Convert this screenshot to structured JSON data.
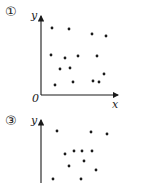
{
  "chart_data": [
    {
      "type": "scatter",
      "panel_label": "①",
      "title": "",
      "xlabel": "x",
      "ylabel": "y",
      "origin_label": "0",
      "grid": false,
      "points_px": [
        [
          52,
          28
        ],
        [
          69,
          29
        ],
        [
          92,
          34
        ],
        [
          106,
          36
        ],
        [
          51,
          55
        ],
        [
          65,
          58
        ],
        [
          78,
          56
        ],
        [
          97,
          56
        ],
        [
          60,
          69
        ],
        [
          70,
          68
        ],
        [
          104,
          74
        ],
        [
          55,
          85
        ],
        [
          73,
          82
        ],
        [
          93,
          81
        ],
        [
          99,
          82
        ]
      ],
      "axes_px": {
        "origin": [
          41,
          95
        ],
        "x_end": 117,
        "y_top": 17
      }
    },
    {
      "type": "scatter",
      "panel_label": "③",
      "title": "",
      "xlabel": "",
      "ylabel": "y",
      "grid": false,
      "points_px": [
        [
          57,
          131
        ],
        [
          91,
          132
        ],
        [
          107,
          134
        ],
        [
          65,
          154
        ],
        [
          74,
          151
        ],
        [
          82,
          151
        ],
        [
          92,
          151
        ],
        [
          84,
          161
        ],
        [
          69,
          166
        ],
        [
          96,
          170
        ],
        [
          53,
          179
        ],
        [
          81,
          179
        ]
      ],
      "axes_px": {
        "origin": [
          41,
          190
        ],
        "y_top": 121
      }
    }
  ],
  "labels": {
    "p1_num": "①",
    "p1_y": "y",
    "p1_x": "x",
    "p1_o": "0",
    "p3_num": "③",
    "p3_y": "y"
  },
  "colors": {
    "ink": "#1a1a1a"
  }
}
